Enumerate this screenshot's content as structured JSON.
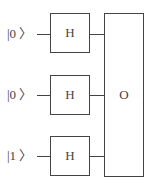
{
  "qubits": [
    {
      "ket": "|0 〉",
      "gate": "H"
    },
    {
      "ket": "|0 〉",
      "gate": "H"
    },
    {
      "ket": "|1 〉",
      "gate": "H"
    }
  ],
  "oracle": {
    "label": "O"
  }
}
